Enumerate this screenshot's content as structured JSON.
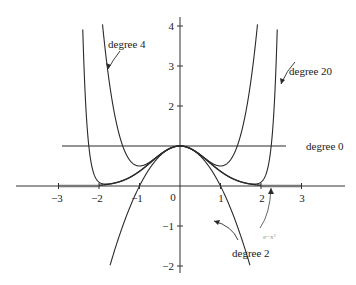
{
  "chart_data": {
    "type": "line",
    "title": "",
    "xlabel": "",
    "ylabel": "",
    "xlim": [
      -3.5,
      4.3
    ],
    "ylim": [
      -2.2,
      4.2
    ],
    "grid": false,
    "legend": "inline labels with arrows",
    "x_ticks": [
      -3,
      -2,
      -1,
      0,
      1,
      2,
      3
    ],
    "x_tick_labels": [
      "−3",
      "−2",
      "−1",
      "0",
      "1",
      "2",
      "3"
    ],
    "y_ticks": [
      -2,
      -1,
      1,
      2,
      3,
      4
    ],
    "y_tick_labels": [
      "−2",
      "−1",
      "1",
      "2",
      "3",
      "4"
    ],
    "series": [
      {
        "name": "degree 0",
        "formula": "1",
        "x_range": [
          -2.9,
          2.6
        ]
      },
      {
        "name": "degree 2",
        "formula": "1 - x^2",
        "x_range": [
          -1.77,
          1.77
        ]
      },
      {
        "name": "degree 4",
        "formula": "1 - x^2 + x^4/2",
        "x_range": [
          -1.93,
          1.93
        ]
      },
      {
        "name": "degree 20",
        "formula": "sum_{k=0}^{10} (-1)^k x^(2k)/k!",
        "x_range": [
          -2.3,
          2.3
        ]
      },
      {
        "name": "e^{-x^2}",
        "formula": "exp(-x^2)",
        "x_range": [
          -3,
          3
        ]
      }
    ],
    "annotations": [
      {
        "text": "degree 4",
        "points_to": [
          -1.5,
          2.5
        ]
      },
      {
        "text": "degree 20",
        "points_to": [
          2.4,
          3.1
        ]
      },
      {
        "text": "degree 0",
        "points_to": [
          2.6,
          1
        ]
      },
      {
        "text": "degree 2",
        "points_to": [
          1.4,
          -0.96
        ]
      },
      {
        "text": "e^{-x^2}",
        "points_to": [
          2.5,
          0
        ]
      }
    ],
    "shaded_segments": [
      [
        -3,
        -2
      ],
      [
        2,
        3
      ]
    ]
  },
  "labels": {
    "degree_4": "degree 4",
    "degree_20": "degree 20",
    "degree_0": "degree 0",
    "degree_2": "degree 2",
    "gauss": "e−x²"
  },
  "ticks": {
    "x": [
      "−3",
      "−2",
      "−1",
      "0",
      "1",
      "2",
      "3"
    ],
    "y": [
      "4",
      "3",
      "2",
      "−1",
      "−2"
    ]
  }
}
